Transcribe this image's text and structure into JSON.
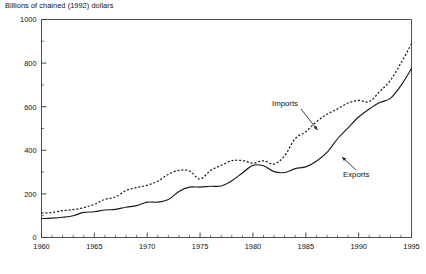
{
  "chart_data": {
    "type": "line",
    "title": "Billions of chained (1992) dollars",
    "xlabel": "",
    "ylabel": "Billions of chained (1992) dollars",
    "xlim": [
      1960,
      1995
    ],
    "ylim": [
      0,
      1000
    ],
    "grid": false,
    "legend_position": "inline-annotations",
    "x_ticks_major": [
      1960,
      1965,
      1970,
      1975,
      1980,
      1985,
      1990,
      1995
    ],
    "x_tick_labels": [
      "1960",
      "1965",
      "1970",
      "1975",
      "1980",
      "1985",
      "1990",
      "1995"
    ],
    "x_minor_step": 1,
    "y_ticks_major": [
      0,
      200,
      400,
      600,
      800,
      1000
    ],
    "y_tick_labels": [
      "0",
      "200",
      "400",
      "600",
      "800",
      "1000"
    ],
    "y_minor_step": 100,
    "x": [
      1960,
      1961,
      1962,
      1963,
      1964,
      1965,
      1966,
      1967,
      1968,
      1969,
      1970,
      1971,
      1972,
      1973,
      1974,
      1975,
      1976,
      1977,
      1978,
      1979,
      1980,
      1981,
      1982,
      1983,
      1984,
      1985,
      1986,
      1987,
      1988,
      1989,
      1990,
      1991,
      1992,
      1993,
      1994,
      1995
    ],
    "series": [
      {
        "name": "Imports",
        "style": "dotted",
        "color": "#1a1a1a",
        "values": [
          112,
          115,
          123,
          128,
          137,
          152,
          175,
          186,
          216,
          229,
          240,
          258,
          290,
          308,
          305,
          268,
          308,
          331,
          352,
          353,
          341,
          352,
          337,
          375,
          454,
          485,
          531,
          565,
          590,
          617,
          629,
          623,
          670,
          720,
          800,
          888
        ]
      },
      {
        "name": "Exports",
        "style": "solid",
        "color": "#1a1a1a",
        "values": [
          87,
          89,
          93,
          100,
          115,
          118,
          126,
          129,
          139,
          146,
          162,
          162,
          174,
          211,
          231,
          231,
          235,
          236,
          260,
          296,
          331,
          329,
          302,
          298,
          316,
          324,
          350,
          390,
          453,
          503,
          553,
          589,
          619,
          638,
          697,
          775
        ]
      }
    ],
    "annotations": [
      {
        "text": "Imports",
        "x": 1983.2,
        "y": 560
      },
      {
        "text": "Exports",
        "x": 1989.8,
        "y": 300
      }
    ]
  },
  "footnote": {
    "text": ""
  }
}
